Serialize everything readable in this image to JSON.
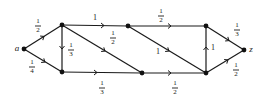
{
  "diagram": {
    "type": "directed-weighted-graph",
    "nodes": [
      {
        "id": "a",
        "label": "a",
        "x": 24,
        "y": 49
      },
      {
        "id": "b",
        "label": "",
        "x": 62,
        "y": 25
      },
      {
        "id": "c",
        "label": "",
        "x": 62,
        "y": 72
      },
      {
        "id": "d",
        "label": "",
        "x": 128,
        "y": 26
      },
      {
        "id": "e",
        "label": "",
        "x": 142,
        "y": 73
      },
      {
        "id": "f",
        "label": "",
        "x": 206,
        "y": 26
      },
      {
        "id": "g",
        "label": "",
        "x": 206,
        "y": 73
      },
      {
        "id": "z",
        "label": "z",
        "x": 244,
        "y": 50
      }
    ],
    "edges": [
      {
        "from": "a",
        "to": "b",
        "weight": {
          "num": "1",
          "den": "2"
        }
      },
      {
        "from": "a",
        "to": "c",
        "weight": {
          "num": "1",
          "den": "4"
        }
      },
      {
        "from": "b",
        "to": "c",
        "weight": {
          "num": "1",
          "den": "3"
        }
      },
      {
        "from": "b",
        "to": "d",
        "weight": {
          "num": "1",
          "den": ""
        }
      },
      {
        "from": "b",
        "to": "e",
        "weight": {
          "num": "1",
          "den": "2"
        }
      },
      {
        "from": "c",
        "to": "e",
        "weight": {
          "num": "1",
          "den": "3"
        }
      },
      {
        "from": "d",
        "to": "f",
        "weight": {
          "num": "1",
          "den": "2"
        }
      },
      {
        "from": "d",
        "to": "g",
        "weight": {
          "num": "1",
          "den": ""
        }
      },
      {
        "from": "e",
        "to": "g",
        "weight": {
          "num": "1",
          "den": "2"
        }
      },
      {
        "from": "g",
        "to": "f",
        "weight": {
          "num": "1",
          "den": ""
        }
      },
      {
        "from": "f",
        "to": "z",
        "weight": {
          "num": "1",
          "den": "3"
        }
      },
      {
        "from": "g",
        "to": "z",
        "weight": {
          "num": "1",
          "den": "2"
        }
      }
    ]
  },
  "labels": {
    "a": "a",
    "z": "z",
    "ab": {
      "num": "1",
      "den": "2"
    },
    "ac": {
      "num": "1",
      "den": "4"
    },
    "bc": {
      "num": "1",
      "den": "3"
    },
    "bd": "1",
    "be": {
      "num": "1",
      "den": "2"
    },
    "ce": {
      "num": "1",
      "den": "3"
    },
    "df": {
      "num": "1",
      "den": "2"
    },
    "dg": "1",
    "eg": {
      "num": "1",
      "den": "2"
    },
    "gf": "1",
    "fz": {
      "num": "1",
      "den": "3"
    },
    "gz": {
      "num": "1",
      "den": "2"
    }
  }
}
